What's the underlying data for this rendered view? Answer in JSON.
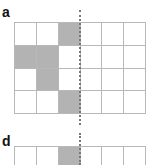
{
  "panels": [
    {
      "label": "a",
      "cols": 6,
      "rows": 4,
      "filled_cells": [
        [
          0,
          2
        ],
        [
          1,
          0
        ],
        [
          1,
          1
        ],
        [
          2,
          1
        ],
        [
          3,
          2
        ]
      ]
    },
    {
      "label": "d",
      "cols": 6,
      "rows": 1,
      "filled_cells": [
        [
          0,
          2
        ]
      ]
    }
  ],
  "colors": {
    "filled": "#b3b3b3",
    "empty": "#ffffff",
    "gridline": "#b8b8b8",
    "divider": "#777777"
  }
}
